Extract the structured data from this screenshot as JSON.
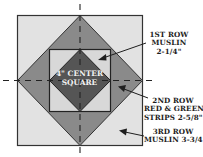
{
  "diagram": {
    "colors": {
      "background": "#ffffff",
      "outer_muslin": "#e2e2e2",
      "second_row_triangles": "#8a8a8a",
      "inner_muslin": "#d8d8d8",
      "center_square": "#555555",
      "outline": "#333333",
      "dashes": "#222222"
    },
    "center_label": {
      "line1": "4\" CENTER",
      "line2": "SQUARE"
    },
    "labels": [
      {
        "id": "row-1",
        "lines": [
          "1ST ROW",
          "MUSLIN",
          "2-1/4\""
        ]
      },
      {
        "id": "row-2",
        "lines": [
          "2ND ROW",
          "RED & GREEN",
          "STRIPS 2-5/8\""
        ]
      },
      {
        "id": "row-3",
        "lines": [
          "3RD ROW",
          "MUSLIN 3-3/4\""
        ]
      }
    ]
  }
}
